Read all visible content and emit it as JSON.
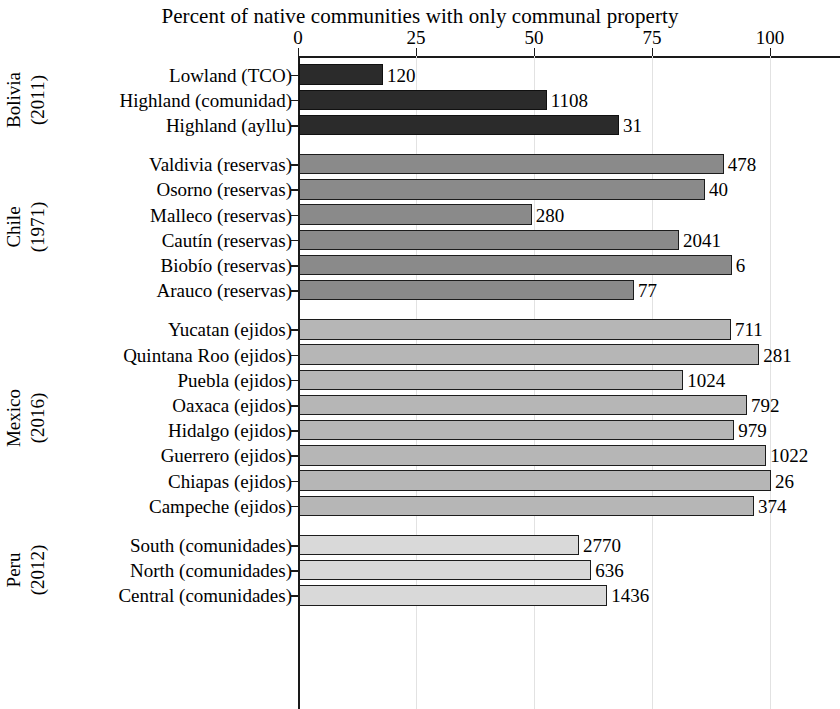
{
  "chart_data": {
    "type": "bar",
    "orientation": "horizontal",
    "title": "Percent of native communities with only communal property",
    "xlabel": "",
    "ylabel": "",
    "xlim": [
      0,
      100
    ],
    "xticks": [
      0,
      25,
      50,
      75,
      100
    ],
    "xtick_labels": [
      "0",
      "25",
      "50",
      "75",
      "100"
    ],
    "grid": true,
    "grid_axis": "x",
    "legend": "none",
    "groups": [
      {
        "name": "Bolivia",
        "year": "(2011)",
        "color": "#2b2b2b",
        "rows": [
          {
            "label": "Lowland (TCO)",
            "value": 17.8,
            "count_label": "120"
          },
          {
            "label": "Highland (comunidad)",
            "value": 52.5,
            "count_label": "1108"
          },
          {
            "label": "Highland (ayllu)",
            "value": 67.8,
            "count_label": "31"
          }
        ]
      },
      {
        "name": "Chile",
        "year": "(1971)",
        "color": "#8a8a8a",
        "rows": [
          {
            "label": "Valdivia (reservas)",
            "value": 90.0,
            "count_label": "478"
          },
          {
            "label": "Osorno (reservas)",
            "value": 86.0,
            "count_label": "40"
          },
          {
            "label": "Malleco (reservas)",
            "value": 49.3,
            "count_label": "280"
          },
          {
            "label": "Cautín (reservas)",
            "value": 80.5,
            "count_label": "2041"
          },
          {
            "label": "Biobío (reservas)",
            "value": 91.7,
            "count_label": "6"
          },
          {
            "label": "Arauco (reservas)",
            "value": 71.0,
            "count_label": "77"
          }
        ]
      },
      {
        "name": "Mexico",
        "year": "(2016)",
        "color": "#b6b6b6",
        "rows": [
          {
            "label": "Yucatan (ejidos)",
            "value": 91.5,
            "count_label": "711"
          },
          {
            "label": "Quintana Roo (ejidos)",
            "value": 97.5,
            "count_label": "281"
          },
          {
            "label": "Puebla (ejidos)",
            "value": 81.4,
            "count_label": "1024"
          },
          {
            "label": "Oaxaca (ejidos)",
            "value": 94.9,
            "count_label": "792"
          },
          {
            "label": "Hidalgo (ejidos)",
            "value": 92.2,
            "count_label": "979"
          },
          {
            "label": "Guerrero (ejidos)",
            "value": 99.0,
            "count_label": "1022"
          },
          {
            "label": "Chiapas (ejidos)",
            "value": 100.0,
            "count_label": "26"
          },
          {
            "label": "Campeche (ejidos)",
            "value": 96.4,
            "count_label": "374"
          }
        ]
      },
      {
        "name": "Peru",
        "year": "(2012)",
        "color": "#d9d9d9",
        "rows": [
          {
            "label": "South (comunidades)",
            "value": 59.3,
            "count_label": "2770"
          },
          {
            "label": "North (comunidades)",
            "value": 61.9,
            "count_label": "636"
          },
          {
            "label": "Central (comunidades)",
            "value": 65.3,
            "count_label": "1436"
          }
        ]
      }
    ]
  }
}
